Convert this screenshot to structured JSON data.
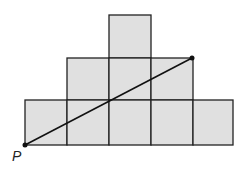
{
  "figure": {
    "point_label": "P",
    "fill_color": "#e0e0e0",
    "stroke_color": "#222222",
    "rows": [
      {
        "row": "bottom",
        "squares": 5
      },
      {
        "row": "middle",
        "squares": 4
      },
      {
        "row": "top",
        "squares": 1
      }
    ]
  }
}
